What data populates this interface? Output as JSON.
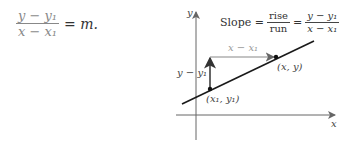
{
  "equation": {
    "numerator": "y − y₁",
    "denominator": "x − x₁",
    "rhs": "= m."
  },
  "graph": {
    "y_axis_label": "y",
    "x_axis_label": "x",
    "slope_formula": {
      "prefix": "Slope =",
      "frac1_num": "rise",
      "frac1_den": "run",
      "equals": "=",
      "frac2_num": "y − y₁",
      "frac2_den": "x − x₁"
    },
    "run_label": "x − x₁",
    "rise_label": "y − y₁",
    "point1_label": "(x₁, y₁)",
    "point2_label": "(x, y)",
    "colors": {
      "line": "#1a1a1a",
      "arrow": "#777777",
      "axis": "#666666"
    }
  }
}
